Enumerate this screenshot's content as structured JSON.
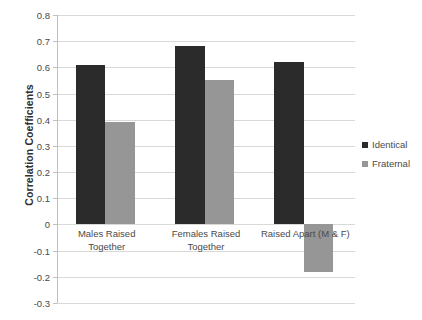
{
  "chart_data": {
    "type": "bar",
    "title": "",
    "xlabel": "",
    "ylabel": "Correlation Coefficients",
    "categories": [
      "Males Raised Together",
      "Females Raised Together",
      "Raised Apart (M & F)"
    ],
    "series": [
      {
        "name": "Identical",
        "color": "#2b2b2b",
        "values": [
          0.61,
          0.68,
          0.62
        ]
      },
      {
        "name": "Fraternal",
        "color": "#969696",
        "values": [
          0.39,
          0.55,
          -0.18
        ]
      }
    ],
    "ylim": [
      -0.3,
      0.8
    ],
    "ytick_step": 0.1,
    "yticks": [
      0.8,
      0.7,
      0.6,
      0.5,
      0.4,
      0.3,
      0.2,
      0.1,
      0,
      -0.1,
      -0.2,
      -0.3
    ],
    "ytick_labels": [
      "0.8",
      "0.7",
      "0.6",
      "0.5",
      "0.4",
      "0.3",
      "0.2",
      "0.1",
      "0",
      "-0.1",
      "-0.2",
      "-0.3"
    ],
    "grid": true,
    "grid_axis": "y",
    "legend_position": "right",
    "legend_entries": [
      "Identical",
      "Fraternal"
    ],
    "background_color": "#ffffff",
    "gridline_color": "#d9d9d9",
    "axis_color": "#bfbfbf",
    "text_color": "#4a4a4a"
  }
}
